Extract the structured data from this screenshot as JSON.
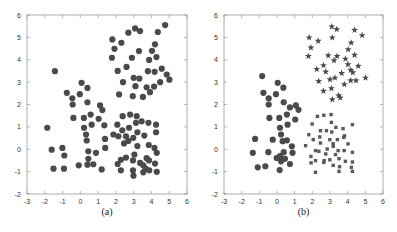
{
  "chart_data": [
    {
      "panel": "a",
      "type": "scatter",
      "caption": "(a)",
      "title": "",
      "xlabel": "",
      "ylabel": "",
      "xlim": [
        -3,
        6
      ],
      "ylim": [
        -2,
        6
      ],
      "xticks": [
        -3,
        -2,
        -1,
        0,
        1,
        2,
        3,
        4,
        5,
        6
      ],
      "yticks": [
        -2,
        -1,
        0,
        1,
        2,
        3,
        4,
        5,
        6
      ],
      "grid": false,
      "legend": null,
      "series": [
        {
          "name": "all points",
          "marker": "circle",
          "color": "#4a4a4a",
          "points": [
            [
              4.77,
              5.55
            ],
            [
              2.7,
              5.21
            ],
            [
              3.08,
              5.4
            ],
            [
              3.36,
              5.28
            ],
            [
              4.36,
              5.24
            ],
            [
              1.8,
              4.91
            ],
            [
              2.31,
              4.76
            ],
            [
              4.2,
              4.69
            ],
            [
              1.92,
              4.49
            ],
            [
              3.3,
              4.39
            ],
            [
              4.03,
              4.4
            ],
            [
              1.78,
              4.09
            ],
            [
              2.9,
              4.09
            ],
            [
              4.28,
              4.12
            ],
            [
              3.87,
              3.99
            ],
            [
              2.6,
              3.68
            ],
            [
              4.58,
              3.6
            ],
            [
              2.1,
              3.5
            ],
            [
              3.8,
              3.49
            ],
            [
              4.18,
              3.46
            ],
            [
              4.86,
              3.34
            ],
            [
              5.01,
              3.11
            ],
            [
              3.0,
              3.19
            ],
            [
              3.32,
              3.16
            ],
            [
              2.4,
              3.0
            ],
            [
              4.49,
              3.0
            ],
            [
              3.1,
              2.82
            ],
            [
              4.15,
              2.8
            ],
            [
              3.73,
              2.77
            ],
            [
              3.92,
              2.55
            ],
            [
              2.18,
              2.45
            ],
            [
              2.95,
              2.37
            ],
            [
              3.52,
              2.34
            ],
            [
              -1.43,
              3.49
            ],
            [
              0.07,
              2.97
            ],
            [
              0.4,
              2.74
            ],
            [
              -0.76,
              2.52
            ],
            [
              -0.03,
              2.46
            ],
            [
              -0.45,
              2.28
            ],
            [
              -0.43,
              2.0
            ],
            [
              0.4,
              2.1
            ],
            [
              1.11,
              1.96
            ],
            [
              1.24,
              1.75
            ],
            [
              -0.39,
              1.4
            ],
            [
              0.2,
              1.4
            ],
            [
              0.58,
              1.55
            ],
            [
              1.03,
              1.36
            ],
            [
              0.64,
              1.1
            ],
            [
              1.35,
              1.07
            ],
            [
              -1.86,
              0.96
            ],
            [
              0.21,
              0.96
            ],
            [
              0.32,
              0.66
            ],
            [
              0.36,
              0.39
            ],
            [
              1.39,
              0.46
            ],
            [
              -1.61,
              -0.02
            ],
            [
              -1.01,
              0.06
            ],
            [
              -0.9,
              -0.28
            ],
            [
              1.4,
              0.06
            ],
            [
              0.45,
              -0.09
            ],
            [
              0.88,
              -0.16
            ],
            [
              -1.51,
              -0.87
            ],
            [
              -0.92,
              -0.87
            ],
            [
              -0.09,
              -0.72
            ],
            [
              0.4,
              -0.69
            ],
            [
              0.73,
              -0.67
            ],
            [
              1.2,
              -0.9
            ],
            [
              0.45,
              -0.43
            ],
            [
              2.8,
              1.55
            ],
            [
              2.38,
              1.48
            ],
            [
              3.17,
              1.48
            ],
            [
              3.45,
              1.25
            ],
            [
              3.83,
              1.18
            ],
            [
              4.26,
              1.1
            ],
            [
              2.08,
              1.1
            ],
            [
              3.13,
              1.18
            ],
            [
              2.74,
              0.96
            ],
            [
              2.36,
              0.85
            ],
            [
              3.21,
              0.76
            ],
            [
              4.26,
              0.76
            ],
            [
              1.86,
              0.66
            ],
            [
              2.14,
              0.58
            ],
            [
              2.57,
              0.58
            ],
            [
              2.98,
              0.51
            ],
            [
              3.6,
              0.61
            ],
            [
              2.7,
              0.37
            ],
            [
              2.46,
              0.26
            ],
            [
              3.21,
              0.14
            ],
            [
              3.85,
              0.19
            ],
            [
              4.17,
              0.06
            ],
            [
              4.3,
              -0.16
            ],
            [
              3.04,
              -0.24
            ],
            [
              2.57,
              -0.37
            ],
            [
              2.28,
              -0.47
            ],
            [
              2.96,
              -0.5
            ],
            [
              3.73,
              -0.4
            ],
            [
              3.86,
              -0.5
            ],
            [
              3.36,
              -0.61
            ],
            [
              2.1,
              -0.66
            ],
            [
              4.2,
              -0.64
            ],
            [
              3.54,
              -0.72
            ],
            [
              3.67,
              -0.87
            ],
            [
              2.96,
              -0.94
            ],
            [
              2.28,
              -0.94
            ],
            [
              3.88,
              -0.94
            ],
            [
              4.3,
              -1.01
            ],
            [
              3.54,
              -1.03
            ],
            [
              2.99,
              -1.18
            ]
          ]
        }
      ]
    },
    {
      "panel": "b",
      "type": "scatter",
      "caption": "(b)",
      "title": "",
      "xlabel": "",
      "ylabel": "",
      "xlim": [
        -3,
        6
      ],
      "ylim": [
        -2,
        6
      ],
      "xticks": [
        -3,
        -2,
        -1,
        0,
        1,
        2,
        3,
        4,
        5,
        6
      ],
      "yticks": [
        -2,
        -1,
        0,
        1,
        2,
        3,
        4,
        5,
        6
      ],
      "grid": false,
      "legend": null,
      "series": [
        {
          "name": "cluster 1",
          "marker": "star",
          "color": "#4a4a4a",
          "points": [
            [
              3.1,
              5.48
            ],
            [
              3.38,
              5.36
            ],
            [
              4.39,
              5.33
            ],
            [
              1.82,
              4.99
            ],
            [
              3.13,
              4.99
            ],
            [
              4.82,
              5.09
            ],
            [
              2.33,
              4.84
            ],
            [
              4.2,
              4.76
            ],
            [
              1.92,
              4.54
            ],
            [
              4.03,
              4.46
            ],
            [
              1.78,
              4.16
            ],
            [
              2.9,
              4.19
            ],
            [
              3.4,
              4.16
            ],
            [
              4.39,
              4.21
            ],
            [
              3.87,
              4.04
            ],
            [
              3.23,
              3.97
            ],
            [
              2.63,
              3.75
            ],
            [
              4.02,
              3.79
            ],
            [
              4.6,
              3.72
            ],
            [
              2.25,
              3.58
            ],
            [
              2.76,
              3.46
            ],
            [
              4.17,
              3.54
            ],
            [
              3.66,
              3.4
            ],
            [
              4.29,
              3.43
            ],
            [
              3.0,
              3.12
            ],
            [
              3.28,
              3.19
            ],
            [
              2.36,
              3.04
            ],
            [
              4.17,
              3.07
            ],
            [
              4.47,
              3.07
            ],
            [
              5.01,
              3.19
            ],
            [
              3.81,
              2.9
            ],
            [
              3.08,
              2.72
            ],
            [
              2.63,
              2.6
            ],
            [
              3.49,
              2.4
            ],
            [
              3.13,
              2.22
            ],
            [
              3.58,
              2.3
            ]
          ]
        },
        {
          "name": "cluster 2",
          "marker": "circle",
          "color": "#4a4a4a",
          "points": [
            [
              -0.84,
              3.27
            ],
            [
              0.04,
              2.97
            ],
            [
              -0.77,
              2.52
            ],
            [
              0.36,
              2.75
            ],
            [
              -0.06,
              2.46
            ],
            [
              -0.47,
              2.28
            ],
            [
              -0.47,
              2.0
            ],
            [
              0.38,
              2.1
            ],
            [
              1.07,
              1.96
            ],
            [
              1.22,
              1.76
            ],
            [
              0.73,
              1.87
            ],
            [
              -0.43,
              1.4
            ],
            [
              0.13,
              1.4
            ],
            [
              0.56,
              1.55
            ],
            [
              1.03,
              1.33
            ],
            [
              0.6,
              1.1
            ],
            [
              0.17,
              0.96
            ],
            [
              -1.24,
              0.46
            ],
            [
              -0.24,
              0.43
            ],
            [
              0.23,
              0.66
            ],
            [
              0.32,
              0.36
            ],
            [
              0.56,
              0.4
            ],
            [
              0.84,
              0.13
            ],
            [
              -1.37,
              -0.16
            ],
            [
              -0.49,
              -0.13
            ],
            [
              0.38,
              -0.13
            ],
            [
              0.88,
              -0.16
            ],
            [
              -0.02,
              -0.39
            ],
            [
              0.23,
              -0.54
            ],
            [
              0.45,
              -0.43
            ],
            [
              0.17,
              -0.31
            ],
            [
              -1.09,
              -0.81
            ],
            [
              -0.66,
              -0.76
            ],
            [
              0.73,
              -0.66
            ],
            [
              0.15,
              -0.93
            ]
          ]
        },
        {
          "name": "cluster 3",
          "marker": "square",
          "color": "#5a5a5a",
          "points": [
            [
              2.29,
              1.47
            ],
            [
              2.65,
              1.52
            ],
            [
              3.06,
              1.55
            ],
            [
              3.08,
              1.2
            ],
            [
              1.99,
              1.13
            ],
            [
              3.33,
              0.98
            ],
            [
              3.74,
              0.92
            ],
            [
              4.27,
              1.1
            ],
            [
              1.8,
              0.65
            ],
            [
              2.46,
              0.83
            ],
            [
              2.8,
              0.83
            ],
            [
              3.1,
              0.77
            ],
            [
              3.82,
              0.6
            ],
            [
              2.05,
              0.43
            ],
            [
              2.42,
              0.55
            ],
            [
              2.99,
              0.43
            ],
            [
              3.42,
              0.43
            ],
            [
              3.78,
              0.53
            ],
            [
              1.62,
              0.16
            ],
            [
              2.46,
              0.28
            ],
            [
              3.18,
              0.25
            ],
            [
              3.18,
              0.13
            ],
            [
              4.02,
              0.24
            ],
            [
              2.18,
              -0.06
            ],
            [
              2.37,
              -0.09
            ],
            [
              2.84,
              0.01
            ],
            [
              3.46,
              -0.06
            ],
            [
              3.8,
              -0.06
            ],
            [
              4.27,
              -0.14
            ],
            [
              1.92,
              -0.32
            ],
            [
              2.76,
              -0.21
            ],
            [
              3.31,
              -0.24
            ],
            [
              2.18,
              -0.51
            ],
            [
              2.67,
              -0.51
            ],
            [
              2.99,
              -0.47
            ],
            [
              3.51,
              -0.42
            ],
            [
              3.87,
              -0.54
            ],
            [
              4.27,
              -0.57
            ],
            [
              1.93,
              -0.61
            ],
            [
              2.65,
              -0.59
            ],
            [
              3.18,
              -0.72
            ],
            [
              3.54,
              -0.78
            ],
            [
              4.21,
              -0.81
            ],
            [
              2.18,
              -1.03
            ],
            [
              3.51,
              -0.99
            ],
            [
              4.27,
              -0.99
            ]
          ]
        }
      ]
    }
  ]
}
